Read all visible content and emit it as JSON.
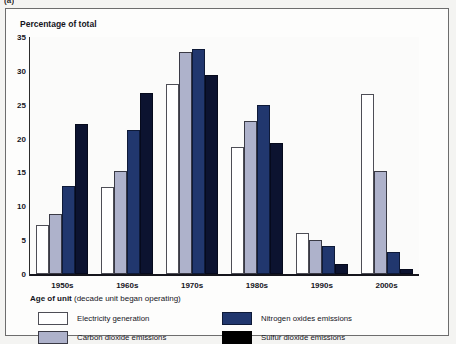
{
  "figure": {
    "label": "(a)",
    "frame_border_color": "#6d6d6d",
    "background_color": "#f4f4f2"
  },
  "chart_data": {
    "type": "bar",
    "title": "Percentage of total",
    "xlabel": "Age of unit (decade unit began operating)",
    "ylabel": "Percentage of total",
    "ylim": [
      0,
      35
    ],
    "ytick_step": 5,
    "grid": false,
    "legend_position": "bottom",
    "categories": [
      "1950s",
      "1960s",
      "1970s",
      "1980s",
      "1990s",
      "2000s"
    ],
    "ytick_labels": [
      "0",
      "5",
      "10",
      "15",
      "20",
      "25",
      "30",
      "35"
    ],
    "ytick_values": [
      0,
      5,
      10,
      15,
      20,
      25,
      30,
      35
    ],
    "series": [
      {
        "name": "Electricity generation",
        "color": "#ffffff",
        "border_color": "#4e4e56",
        "values": [
          7.2,
          12.8,
          28.1,
          18.7,
          6.1,
          26.6
        ]
      },
      {
        "name": "Carbon dioxide emissions",
        "color": "#aeb2cb",
        "border_color": "#3a3a45",
        "values": [
          8.8,
          15.2,
          32.8,
          22.6,
          5.0,
          15.2
        ]
      },
      {
        "name": "Nitrogen oxides emissions",
        "color": "#21376e",
        "border_color": "#0e1a38",
        "values": [
          13.0,
          21.2,
          33.3,
          25.0,
          4.2,
          3.3
        ]
      },
      {
        "name": "Sulfur dioxide emissions",
        "color": "#0c1330",
        "border_color": "#000000",
        "values": [
          22.2,
          26.8,
          29.4,
          19.3,
          1.5,
          0.7
        ]
      }
    ]
  },
  "xaxis_title": {
    "bold_part": "Age of unit",
    "normal_part": " (decade unit began operating)"
  },
  "legend": {
    "entries": [
      {
        "label": "Electricity generation",
        "swatch": "s0"
      },
      {
        "label": "Nitrogen oxides emissions",
        "swatch": "s2"
      },
      {
        "label": "Carbon dioxide emissions",
        "swatch": "s1"
      },
      {
        "label": "Sulfur dioxide emissions",
        "swatch": "s3"
      }
    ]
  }
}
